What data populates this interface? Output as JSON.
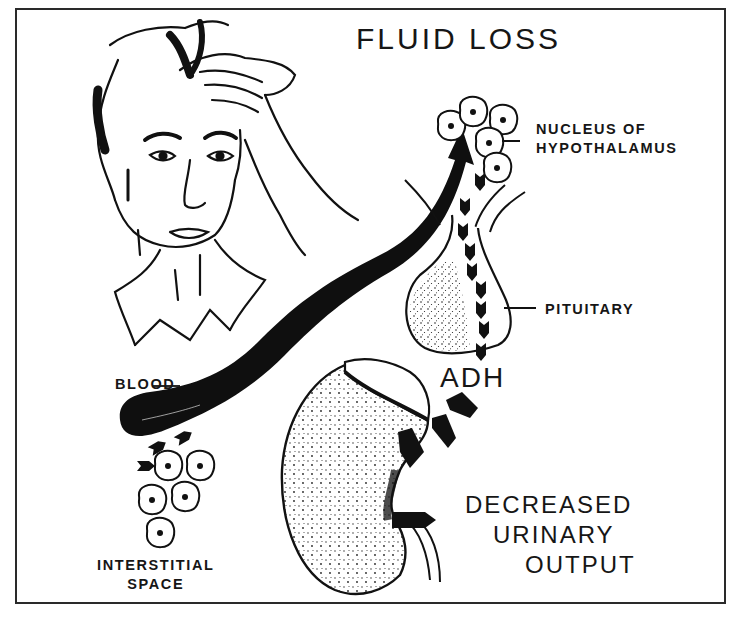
{
  "figure": {
    "title": "FLUID LOSS",
    "labels": {
      "nucleus": [
        "NUCLEUS OF",
        "HYPOTHALAMUS"
      ],
      "pituitary": "PITUITARY",
      "blood": "BLOOD",
      "interstitial": [
        "INTERSTITIAL",
        "SPACE"
      ],
      "hormone": "ADH",
      "outcome": [
        "DECREASED",
        "URINARY",
        "OUTPUT"
      ]
    },
    "elements": [
      {
        "name": "person-wiping-forehead",
        "kind": "illustration"
      },
      {
        "name": "blood-vessel-arrow",
        "kind": "arrow",
        "direction": "to hypothalamus"
      },
      {
        "name": "hypothalamus-neurons",
        "kind": "cells",
        "count": 5
      },
      {
        "name": "pituitary-gland",
        "kind": "organ"
      },
      {
        "name": "kidney",
        "kind": "organ"
      },
      {
        "name": "interstitial-cells",
        "kind": "cells",
        "count": 5
      }
    ],
    "colors": {
      "ink": "#141414",
      "background": "#ffffff",
      "frame": "#2a2a2a"
    }
  }
}
